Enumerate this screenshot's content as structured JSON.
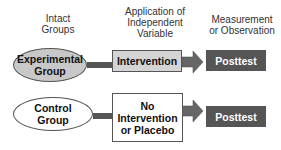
{
  "headers": {
    "groups": "Intact\nGroups",
    "application": "Application of\nIndependent\nVariable",
    "measurement": "Measurement\nor Observation"
  },
  "rows": [
    {
      "group": "Experimental\nGroup",
      "treatment": "Intervention",
      "measure": "Posttest"
    },
    {
      "group": "Control\nGroup",
      "treatment": "No\nIntervention\nor Placebo",
      "measure": "Posttest"
    }
  ],
  "colors": {
    "experimental_fill": "#c8c8c8",
    "control_fill": "#ffffff",
    "intervention_fill": "#d4d4d4",
    "placebo_fill": "#ffffff",
    "posttest_fill": "#555555",
    "connector": "#555555",
    "arrow": "#666666"
  }
}
